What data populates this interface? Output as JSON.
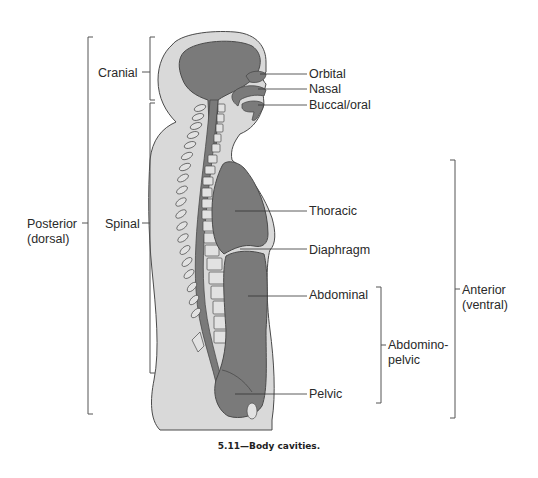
{
  "figure": {
    "caption": "5.11—Body cavities.",
    "colors": {
      "body_fill": "#d9d9d9",
      "cavity_fill": "#7a7a7a",
      "outline": "#4a4a4a",
      "bracket": "#555555",
      "text": "#2a2a2a"
    }
  },
  "labels": {
    "left": {
      "cranial": "Cranial",
      "spinal": "Spinal",
      "posterior_line1": "Posterior",
      "posterior_line2": "(dorsal)"
    },
    "right": {
      "orbital": "Orbital",
      "nasal": "Nasal",
      "buccal": "Buccal/oral",
      "thoracic": "Thoracic",
      "diaphragm": "Diaphragm",
      "abdominal": "Abdominal",
      "pelvic": "Pelvic",
      "abdominopelvic_line1": "Abdomino-",
      "abdominopelvic_line2": "pelvic",
      "anterior_line1": "Anterior",
      "anterior_line2": "(ventral)"
    }
  }
}
